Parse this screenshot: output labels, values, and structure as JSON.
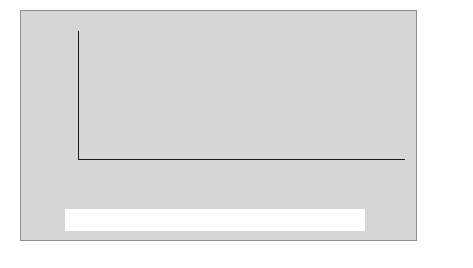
{
  "chart_data": {
    "type": "bar",
    "subtype": "stacked",
    "title": "",
    "xlabel": "",
    "ylabel": "$ Billion",
    "ylim": [
      0,
      2500
    ],
    "ytick_labels": [
      "0",
      "500",
      "1,000",
      "1,500",
      "2,000",
      "2,500"
    ],
    "ytick_values": [
      0,
      500,
      1000,
      1500,
      2000,
      2500
    ],
    "grid": true,
    "grid_axis": "y",
    "legend_position": "bottom",
    "categories": [
      "1988–93",
      "1994",
      "1995",
      "1996",
      "1997",
      "1998",
      "1999",
      "2000",
      "2001",
      "2002",
      "2003",
      "2004",
      "2005",
      "2006",
      "2007",
      "2008",
      "2009",
      "2010",
      "2011",
      "2012",
      "2013"
    ],
    "series": [
      {
        "name": "Developing Countries",
        "color": "#bdbdbd",
        "stack_position": "bottom",
        "values": [
          120,
          160,
          215,
          220,
          265,
          470,
          805,
          1070,
          540,
          510,
          330,
          390,
          580,
          930,
          1270,
          975,
          560,
          645,
          755,
          505,
          505
        ]
      },
      {
        "name": "Developed Countries",
        "color": "#8e8e8e",
        "stack_position": "top",
        "values": [
          75,
          105,
          100,
          145,
          170,
          180,
          235,
          270,
          225,
          110,
          170,
          280,
          330,
          435,
          590,
          665,
          530,
          630,
          735,
          695,
          775
        ]
      }
    ],
    "totals": [
      195,
      265,
      315,
      365,
      435,
      650,
      1040,
      1340,
      765,
      620,
      500,
      670,
      910,
      1365,
      1860,
      1640,
      1090,
      1275,
      1490,
      1200,
      1280
    ]
  },
  "legend": {
    "entries": [
      {
        "label": "Developed Countries",
        "swatch": "developed-swatch"
      },
      {
        "label": "Developing Countries",
        "swatch": "developing-swatch"
      }
    ]
  }
}
